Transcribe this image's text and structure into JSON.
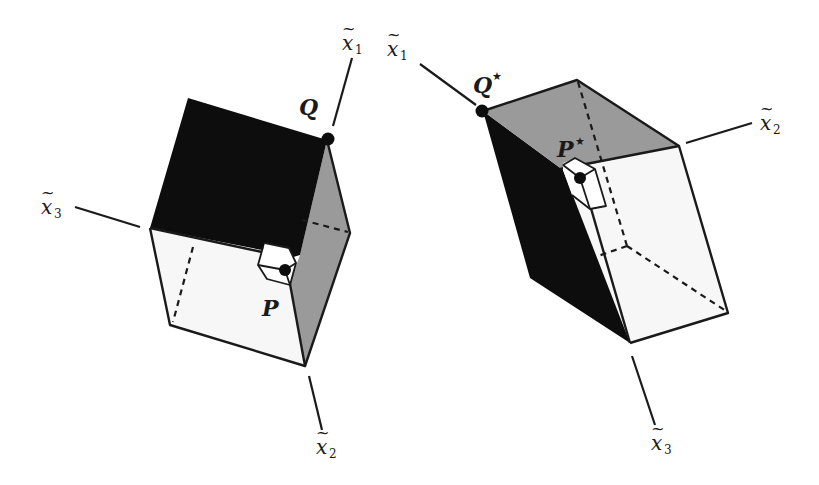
{
  "figure": {
    "colors": {
      "dark_face": "#0d0d0d",
      "gray_face": "#9a9a9a",
      "light_face": "#f7f7f7",
      "stroke": "#1a1a1a"
    },
    "left_cube": {
      "axes": {
        "x1": {
          "base": "x",
          "sub": "1"
        },
        "x2": {
          "base": "x",
          "sub": "2"
        },
        "x3": {
          "base": "x",
          "sub": "3"
        }
      },
      "points": {
        "Q": {
          "label": "Q",
          "star": ""
        },
        "P": {
          "label": "P",
          "star": ""
        }
      }
    },
    "right_cube": {
      "axes": {
        "x1": {
          "base": "x",
          "sub": "1"
        },
        "x2": {
          "base": "x",
          "sub": "2"
        },
        "x3": {
          "base": "x",
          "sub": "3"
        }
      },
      "points": {
        "Q": {
          "label": "Q",
          "star": "★"
        },
        "P": {
          "label": "P",
          "star": "★"
        }
      }
    },
    "tilde": "~"
  }
}
